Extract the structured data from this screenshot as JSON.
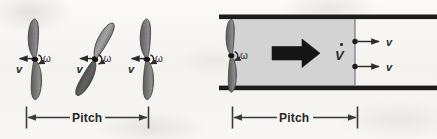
{
  "figure": {
    "background_color": "#f7f6f4",
    "ink_color": "#2b2b2b",
    "blade_fill": "#6f6f6f",
    "blade_stroke": "#3a3a3a",
    "tube_fill": "#d3d3d3",
    "tube_wall_color": "#1c1c1c"
  },
  "left_panel": {
    "name": "propeller-sequence-panel",
    "propellers": [
      {
        "id": "propeller-1",
        "orientation": "vertical",
        "v_label": "v",
        "omega_label": "ω"
      },
      {
        "id": "propeller-2",
        "orientation": "tilted",
        "v_label": "v",
        "omega_label": "ω"
      },
      {
        "id": "propeller-3",
        "orientation": "vertical",
        "v_label": "v",
        "omega_label": "ω"
      }
    ],
    "dimension": {
      "label": "Pitch"
    }
  },
  "right_panel": {
    "name": "propeller-in-tube-panel",
    "propeller": {
      "id": "propeller-tube",
      "orientation": "vertical",
      "omega_label": "ω"
    },
    "flow_arrow": {
      "name": "flow-direction-arrow"
    },
    "volumetric_flow_label": "V",
    "velocity_labels": [
      "v",
      "v"
    ],
    "dimension": {
      "label": "Pitch"
    }
  }
}
